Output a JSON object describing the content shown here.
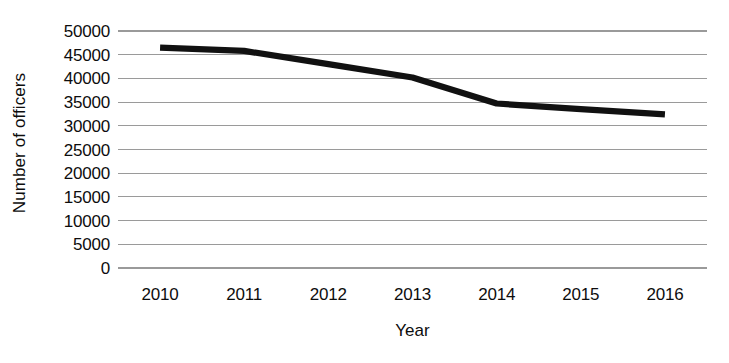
{
  "chart_data": {
    "type": "line",
    "title": "",
    "xlabel": "Year",
    "ylabel": "Number of officers",
    "categories": [
      "2010",
      "2011",
      "2012",
      "2013",
      "2014",
      "2015",
      "2016"
    ],
    "values": [
      46500,
      45800,
      43000,
      40200,
      34700,
      33500,
      32400
    ],
    "series": [
      {
        "name": "Number of officers",
        "values": [
          46500,
          45800,
          43000,
          40200,
          34700,
          33500,
          32400
        ]
      }
    ],
    "ylim": [
      0,
      50000
    ],
    "ytick_labels": [
      "0",
      "5000",
      "10000",
      "15000",
      "20000",
      "25000",
      "30000",
      "35000",
      "40000",
      "45000",
      "50000"
    ],
    "ytick_values": [
      0,
      5000,
      10000,
      15000,
      20000,
      25000,
      30000,
      35000,
      40000,
      45000,
      50000
    ],
    "grid": true,
    "grid_axis": "y",
    "legend": false,
    "legend_position": "none",
    "line_color": "#111111",
    "gridline_color": "#9a9a9a",
    "background_color": "#ffffff"
  }
}
